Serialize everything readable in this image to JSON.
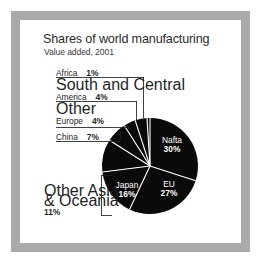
{
  "figure": {
    "frame_color": "#aaaaaa",
    "background": "#ffffff",
    "pie_color": "#0a0a0a",
    "separator_color": "#ffffff",
    "label_color": "#1f1f1f"
  },
  "title": "Shares of world manufacturing",
  "subtitle": "Value added, 2001",
  "chart_data": {
    "type": "pie",
    "title": "Shares of world manufacturing",
    "subtitle": "Value added, 2001",
    "xlabel": "",
    "ylabel": "",
    "unit": "%",
    "legend_position": "callout-labels",
    "grid": false,
    "total": 100,
    "categories": [
      "Nafta",
      "EU",
      "Japan",
      "Other Asia & Oceania",
      "China",
      "Other Europe",
      "South and Central America",
      "Africa"
    ],
    "values": [
      30,
      27,
      16,
      11,
      7,
      4,
      4,
      1
    ],
    "slices": [
      {
        "label": "Nafta",
        "value": 30,
        "percent_text": "30%",
        "placement": "inside"
      },
      {
        "label": "EU",
        "value": 27,
        "percent_text": "27%",
        "placement": "inside"
      },
      {
        "label": "Japan",
        "value": 16,
        "percent_text": "16%",
        "placement": "inside"
      },
      {
        "label": "Other Asia & Oceania",
        "value": 11,
        "percent_text": "11%",
        "placement": "callout"
      },
      {
        "label": "China",
        "value": 7,
        "percent_text": "7%",
        "placement": "callout"
      },
      {
        "label": "Other Europe",
        "value": 4,
        "percent_text": "4%",
        "placement": "callout"
      },
      {
        "label": "South and Central America",
        "value": 4,
        "percent_text": "4%",
        "placement": "callout"
      },
      {
        "label": "Africa",
        "value": 1,
        "percent_text": "1%",
        "placement": "callout"
      }
    ]
  },
  "pie_labels": {
    "nafta": {
      "name": "Nafta",
      "percent": "30%"
    },
    "eu": {
      "name": "EU",
      "percent": "27%"
    },
    "japan": {
      "name": "Japan",
      "percent": "16%"
    }
  },
  "callouts": {
    "africa": {
      "line1": "Africa",
      "percent": "1%"
    },
    "south_central_america": {
      "line1": "South and Central",
      "line2": "America",
      "percent": "4%"
    },
    "other_europe": {
      "line1": "Other",
      "line2": "Europe",
      "percent": "4%"
    },
    "china": {
      "line1": "China",
      "percent": "7%"
    },
    "other_asia_oceania": {
      "line1": "Other Asia",
      "line2": "& Oceania",
      "percent": "11%"
    }
  }
}
